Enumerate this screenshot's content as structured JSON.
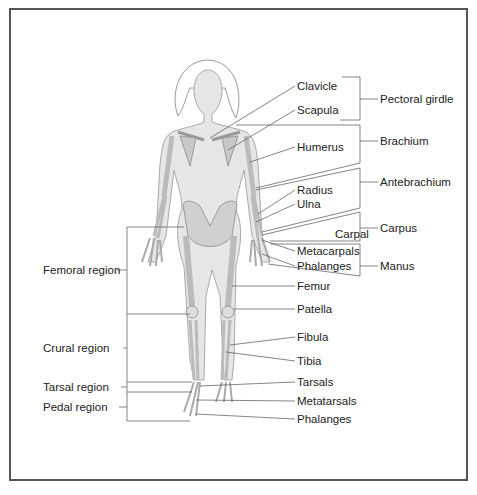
{
  "diagram": {
    "bone_labels": [
      {
        "text": "Clavicle",
        "x": 297,
        "y": 80
      },
      {
        "text": "Scapula",
        "x": 297,
        "y": 104
      },
      {
        "text": "Humerus",
        "x": 297,
        "y": 141
      },
      {
        "text": "Radius",
        "x": 297,
        "y": 184
      },
      {
        "text": "Ulna",
        "x": 297,
        "y": 198
      },
      {
        "text": "Carpal",
        "x": 335,
        "y": 228
      },
      {
        "text": "Metacarpals",
        "x": 297,
        "y": 245
      },
      {
        "text": "Phalanges",
        "x": 297,
        "y": 260
      },
      {
        "text": "Femur",
        "x": 297,
        "y": 280
      },
      {
        "text": "Patella",
        "x": 297,
        "y": 303
      },
      {
        "text": "Fibula",
        "x": 297,
        "y": 331
      },
      {
        "text": "Tibia",
        "x": 297,
        "y": 357
      },
      {
        "text": "Tarsals",
        "x": 297,
        "y": 376
      },
      {
        "text": "Metatarsals",
        "x": 297,
        "y": 395
      },
      {
        "text": "Phalanges",
        "x": 297,
        "y": 413
      }
    ],
    "right_regions": [
      {
        "text": "Pectoral girdle",
        "x": 380,
        "y": 93
      },
      {
        "text": "Brachium",
        "x": 380,
        "y": 135
      },
      {
        "text": "Antebrachium",
        "x": 380,
        "y": 176
      },
      {
        "text": "Carpus",
        "x": 380,
        "y": 222
      },
      {
        "text": "Manus",
        "x": 380,
        "y": 260
      }
    ],
    "left_regions": [
      {
        "text": "Femoral region",
        "x": 43,
        "y": 264
      },
      {
        "text": "Crural region",
        "x": 43,
        "y": 342
      },
      {
        "text": "Tarsal region",
        "x": 43,
        "y": 381
      },
      {
        "text": "Pedal region",
        "x": 43,
        "y": 401
      }
    ]
  }
}
